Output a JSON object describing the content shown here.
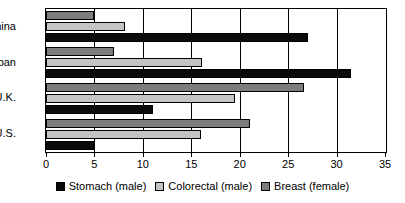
{
  "chart_data": {
    "type": "bar",
    "orientation": "horizontal",
    "title": "",
    "subtitle": "",
    "xlabel": "",
    "ylabel": "",
    "xlim": [
      0,
      35
    ],
    "xticks": [
      0,
      5,
      10,
      15,
      20,
      25,
      30,
      35
    ],
    "xtick_labels": [
      "0",
      "5",
      "10",
      "15",
      "20",
      "25",
      "30",
      "35"
    ],
    "grid": true,
    "grid_axis": "x",
    "legend_position": "bottom",
    "categories": [
      "China",
      "Japan",
      "U.K.",
      "U.S."
    ],
    "series": [
      {
        "name": "Stomach (male)",
        "color": "#0a0a0a",
        "values": [
          27.0,
          31.5,
          11.0,
          5.0
        ]
      },
      {
        "name": "Colorectal (male)",
        "color": "#c4c4c4",
        "values": [
          8.2,
          16.1,
          19.5,
          16.0
        ]
      },
      {
        "name": "Breast (female)",
        "color": "#7d7d7d",
        "values": [
          5.0,
          7.0,
          26.6,
          21.1
        ]
      }
    ],
    "series_draw_order_top_to_bottom": [
      "Breast (female)",
      "Colorectal (male)",
      "Stomach (male)"
    ],
    "axis_color": "#000000",
    "background_color": "#ffffff"
  }
}
